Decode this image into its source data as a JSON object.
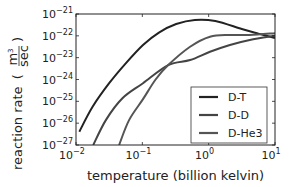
{
  "chart_data": {
    "type": "line",
    "title": "",
    "xlabel": "temperature (billion kelvin)",
    "ylabel": "reaction rate",
    "ylabel_units": {
      "numerator": "m3",
      "numerator_base": "m",
      "numerator_exp": "3",
      "denominator": "sec"
    },
    "xscale": "log",
    "yscale": "log",
    "xlim": [
      0.01,
      10
    ],
    "ylim": [
      1e-27,
      1e-21
    ],
    "grid": false,
    "legend_position": "lower right",
    "x_ticks": [
      {
        "base": "10",
        "exp": "−2",
        "value_log": -2
      },
      {
        "base": "10",
        "exp": "−1",
        "value_log": -1
      },
      {
        "base": "10",
        "exp": "0",
        "value_log": 0
      },
      {
        "base": "10",
        "exp": "1",
        "value_log": 1
      }
    ],
    "y_ticks": [
      {
        "base": "10",
        "exp": "−21",
        "value_log": -21
      },
      {
        "base": "10",
        "exp": "−22",
        "value_log": -22
      },
      {
        "base": "10",
        "exp": "−23",
        "value_log": -23
      },
      {
        "base": "10",
        "exp": "−24",
        "value_log": -24
      },
      {
        "base": "10",
        "exp": "−25",
        "value_log": -25
      },
      {
        "base": "10",
        "exp": "−26",
        "value_log": -26
      },
      {
        "base": "10",
        "exp": "−27",
        "value_log": -27
      }
    ],
    "series": [
      {
        "name": "D-T",
        "color": "#222222",
        "log10_temperature": [
          -1.95,
          -1.75,
          -1.5,
          -1.25,
          -0.99,
          -0.75,
          -0.49,
          -0.21,
          0.1,
          0.5,
          0.75,
          1.0
        ],
        "log10_rate": [
          -26.39,
          -25.25,
          -24.17,
          -23.26,
          -22.42,
          -21.85,
          -21.46,
          -21.27,
          -21.32,
          -21.69,
          -21.9,
          -22.1
        ]
      },
      {
        "name": "D-D",
        "color": "#444444",
        "log10_temperature": [
          -1.74,
          -1.55,
          -1.3,
          -0.99,
          -0.61,
          -0.28,
          0.02,
          0.32,
          0.62,
          1.0
        ],
        "log10_rate": [
          -27.0,
          -25.86,
          -24.86,
          -24.17,
          -23.34,
          -23.11,
          -22.73,
          -22.42,
          -22.19,
          -22.0
        ]
      },
      {
        "name": "D-He3",
        "color": "#555555",
        "log10_temperature": [
          -1.35,
          -1.2,
          -0.99,
          -0.8,
          -0.61,
          -0.28,
          0.02,
          0.32,
          0.62,
          1.0
        ],
        "log10_rate": [
          -27.0,
          -25.86,
          -24.9,
          -24.0,
          -23.34,
          -22.5,
          -22.04,
          -21.96,
          -21.96,
          -21.88
        ]
      }
    ]
  }
}
